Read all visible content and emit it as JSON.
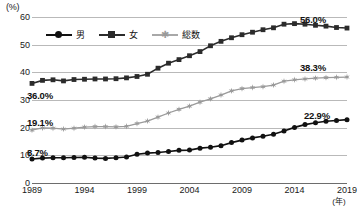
{
  "chart_data": {
    "type": "line",
    "title": "",
    "xlabel": "年",
    "ylabel": "(%)",
    "ylim": [
      0,
      60
    ],
    "xlim": [
      1989,
      2019
    ],
    "grid": true,
    "legend_position": "top-left",
    "y_ticks": [
      "60",
      "50",
      "40",
      "30",
      "20",
      "10",
      "0"
    ],
    "y_tick_values": [
      60,
      50,
      40,
      30,
      20,
      10,
      0
    ],
    "x_ticks": [
      "1989",
      "1994",
      "1999",
      "2004",
      "2009",
      "2014",
      "2019"
    ],
    "x_tick_values": [
      1989,
      1994,
      1999,
      2004,
      2009,
      2014,
      2019
    ],
    "x": [
      1989,
      1990,
      1991,
      1992,
      1993,
      1994,
      1995,
      1996,
      1997,
      1998,
      1999,
      2000,
      2001,
      2002,
      2003,
      2004,
      2005,
      2006,
      2007,
      2008,
      2009,
      2010,
      2011,
      2012,
      2013,
      2014,
      2015,
      2016,
      2017,
      2018,
      2019
    ],
    "series": [
      {
        "name": "男",
        "marker": "circle",
        "color": "#111111",
        "start_label": "8.7%",
        "end_label": "22.9%",
        "values": [
          8.7,
          9.0,
          9.1,
          9.1,
          9.2,
          9.3,
          9.0,
          8.9,
          9.1,
          9.4,
          10.4,
          10.8,
          11.0,
          11.4,
          11.8,
          11.9,
          12.6,
          12.9,
          13.5,
          14.6,
          15.5,
          16.3,
          16.9,
          17.6,
          18.8,
          20.1,
          21.1,
          21.8,
          22.3,
          22.6,
          22.9
        ]
      },
      {
        "name": "女",
        "marker": "square",
        "color": "#2b2b2b",
        "start_label": "36.0%",
        "end_label": "56.0%",
        "values": [
          36.0,
          37.1,
          37.3,
          36.9,
          37.4,
          37.5,
          37.6,
          37.6,
          37.7,
          38.0,
          38.5,
          39.3,
          41.5,
          43.3,
          44.6,
          46.0,
          47.5,
          49.6,
          51.2,
          52.5,
          53.6,
          54.5,
          55.4,
          56.1,
          57.4,
          57.6,
          57.4,
          57.0,
          56.7,
          56.2,
          56.0
        ]
      },
      {
        "name": "総数",
        "marker": "star",
        "color": "#9a9a9a",
        "start_label": "19.1%",
        "end_label": "38.3%",
        "values": [
          19.1,
          19.9,
          19.8,
          19.5,
          19.8,
          20.2,
          20.4,
          20.4,
          20.3,
          20.5,
          21.5,
          22.4,
          23.8,
          25.3,
          26.6,
          27.8,
          29.2,
          30.4,
          31.8,
          33.3,
          34.1,
          34.5,
          34.8,
          35.4,
          36.8,
          37.3,
          37.6,
          37.9,
          38.1,
          38.2,
          38.3
        ]
      }
    ]
  },
  "legend": {
    "items": [
      {
        "label": "男",
        "marker": "circle-marker"
      },
      {
        "label": "女",
        "marker": "square-marker"
      },
      {
        "label": "総数",
        "marker": "star-marker"
      }
    ]
  },
  "axes": {
    "y_unit": "(%)",
    "x_unit": "(年)"
  },
  "annotations": {
    "female_start": "36.0%",
    "female_end": "56.0%",
    "total_start": "19.1%",
    "total_end": "38.3%",
    "male_start": "8.7%",
    "male_end": "22.9%"
  },
  "footnote": ""
}
